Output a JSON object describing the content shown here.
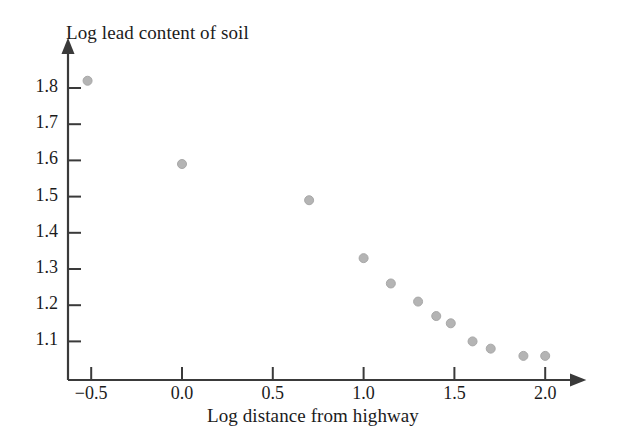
{
  "figure": {
    "background_color": "#ffffff",
    "axis_color": "#3a3a3a",
    "text_color": "#1b1b1b",
    "point_color": "#b4b4b4",
    "point_edge_color": "#a8a8a8"
  },
  "chart_data": {
    "type": "scatter",
    "title": "",
    "xlabel": "Log distance from highway",
    "ylabel": "Log lead content of soil",
    "xlim": [
      -0.72,
      2.15
    ],
    "ylim": [
      1.035,
      1.855
    ],
    "xticks": [
      -0.5,
      0.0,
      0.5,
      1.0,
      1.5,
      2.0
    ],
    "xticklabels": [
      "−0.5",
      "0.0",
      "0.5",
      "1.0",
      "1.5",
      "2.0"
    ],
    "yticks": [
      1.1,
      1.2,
      1.3,
      1.4,
      1.5,
      1.6,
      1.7,
      1.8
    ],
    "yticklabels": [
      "1.1",
      "1.2",
      "1.3",
      "1.4",
      "1.5",
      "1.6",
      "1.7",
      "1.8"
    ],
    "grid": false,
    "legend": null,
    "marker": "filled-circle",
    "marker_size_px": 9,
    "series": [
      {
        "name": "Soil lead vs distance",
        "x": [
          -0.52,
          0.0,
          0.7,
          1.0,
          1.15,
          1.3,
          1.4,
          1.48,
          1.6,
          1.7,
          1.88,
          2.0
        ],
        "y": [
          1.82,
          1.59,
          1.49,
          1.33,
          1.26,
          1.21,
          1.17,
          1.15,
          1.1,
          1.08,
          1.06,
          1.06
        ]
      }
    ],
    "annotations": []
  }
}
